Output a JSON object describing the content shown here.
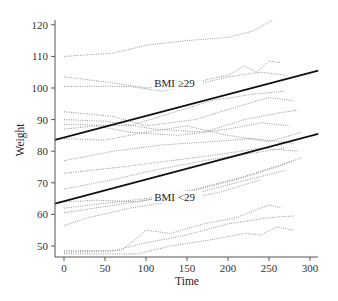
{
  "chart_data": {
    "type": "line",
    "title": "",
    "xlabel": "Time",
    "ylabel": "Weight",
    "xlim": [
      -10,
      310
    ],
    "ylim": [
      47,
      123
    ],
    "grid": false,
    "legend": null,
    "x_ticks": [
      0,
      50,
      100,
      150,
      200,
      250,
      300
    ],
    "x_tick_labels": [
      "0",
      "50",
      "100",
      "150",
      "200",
      "250",
      "300"
    ],
    "y_ticks": [
      50,
      60,
      70,
      80,
      90,
      100,
      110,
      120
    ],
    "y_tick_labels": [
      "50",
      "60",
      "70",
      "80",
      "90",
      "100",
      "110",
      "120"
    ],
    "annotations": [
      {
        "text": "BMI ≥29",
        "x": 110,
        "y": 100.5
      },
      {
        "text": "BMI <29",
        "x": 110,
        "y": 64.5
      }
    ],
    "regression_lines": [
      {
        "name": "BMI ≥29",
        "x": [
          -11,
          310
        ],
        "y": [
          83.6,
          105.5
        ]
      },
      {
        "name": "BMI <29",
        "x": [
          -11,
          310
        ],
        "y": [
          63.4,
          85.5
        ]
      }
    ],
    "series": [
      {
        "name": "subject-1",
        "x": [
          0,
          60,
          100,
          150,
          200,
          230,
          255
        ],
        "y": [
          110,
          111,
          113.5,
          115,
          116,
          118,
          121.5
        ]
      },
      {
        "name": "subject-2",
        "x": [
          0,
          50,
          100,
          150,
          180,
          200,
          220,
          235,
          250,
          265
        ],
        "y": [
          103.5,
          102,
          100,
          101,
          103,
          104,
          107,
          105,
          108.5,
          108
        ]
      },
      {
        "name": "subject-3",
        "x": [
          0,
          80,
          120,
          160,
          200,
          240,
          270
        ],
        "y": [
          100.5,
          100.5,
          99,
          101,
          103.5,
          105,
          104
        ]
      },
      {
        "name": "subject-4",
        "x": [
          0,
          60,
          100,
          160,
          210,
          250,
          280
        ],
        "y": [
          92.5,
          91,
          88,
          90,
          94,
          97,
          96
        ]
      },
      {
        "name": "subject-5",
        "x": [
          0,
          50,
          110,
          170,
          220,
          260,
          285
        ],
        "y": [
          90,
          89.5,
          87,
          86,
          90,
          92,
          93
        ]
      },
      {
        "name": "subject-6",
        "x": [
          0,
          40,
          80,
          140,
          200,
          240,
          275
        ],
        "y": [
          87,
          88,
          86,
          85,
          87,
          89,
          88
        ]
      },
      {
        "name": "subject-7",
        "x": [
          0,
          50,
          100,
          150,
          200,
          250,
          290
        ],
        "y": [
          84,
          83.5,
          86,
          88,
          85,
          83,
          86
        ]
      },
      {
        "name": "subject-8",
        "x": [
          0,
          60,
          120,
          180,
          230,
          280
        ],
        "y": [
          77,
          80,
          82,
          83,
          84,
          82.5
        ]
      },
      {
        "name": "subject-9",
        "x": [
          0,
          70,
          130,
          190,
          240,
          285
        ],
        "y": [
          73,
          75,
          77,
          79,
          81,
          80
        ]
      },
      {
        "name": "subject-10",
        "x": [
          0,
          60,
          110,
          170,
          220,
          270
        ],
        "y": [
          68,
          71,
          74,
          77,
          79,
          81
        ]
      },
      {
        "name": "subject-11",
        "x": [
          0,
          40,
          90,
          150,
          210,
          260,
          290
        ],
        "y": [
          64,
          64.5,
          64,
          67,
          71,
          75,
          78
        ]
      },
      {
        "name": "subject-12",
        "x": [
          0,
          50,
          100,
          160,
          220,
          280
        ],
        "y": [
          62,
          63.5,
          65,
          68,
          72,
          77
        ]
      },
      {
        "name": "subject-13",
        "x": [
          0,
          50,
          100,
          150,
          210,
          270
        ],
        "y": [
          60.5,
          62.5,
          64.5,
          66,
          70,
          74
        ]
      },
      {
        "name": "subject-14",
        "x": [
          0,
          30,
          80,
          130,
          190,
          240
        ],
        "y": [
          56.5,
          59,
          62,
          64,
          67,
          71
        ]
      },
      {
        "name": "subject-15",
        "x": [
          0,
          70,
          100,
          130,
          170,
          210,
          250,
          265
        ],
        "y": [
          48.5,
          48.5,
          55,
          54,
          57,
          59,
          63,
          62
        ]
      },
      {
        "name": "subject-16",
        "x": [
          0,
          60,
          100,
          150,
          200,
          250,
          280
        ],
        "y": [
          48,
          48.5,
          51,
          53.5,
          57,
          59,
          59.5
        ]
      },
      {
        "name": "subject-17",
        "x": [
          0,
          90,
          130,
          180,
          220,
          240,
          260,
          280
        ],
        "y": [
          47.5,
          47.5,
          50,
          52,
          54,
          53.5,
          56,
          55
        ]
      },
      {
        "name": "subject-18",
        "x": [
          0,
          80,
          130,
          180,
          230,
          270
        ],
        "y": [
          88.5,
          88,
          92,
          96,
          98,
          99
        ]
      }
    ]
  }
}
